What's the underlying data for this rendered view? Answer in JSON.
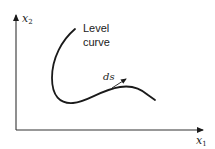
{
  "diagram": {
    "axes": {
      "y_label": "x",
      "y_sub": "2",
      "x_label": "x",
      "x_sub": "1"
    },
    "curve_label": {
      "line1": "Level",
      "line2": "curve"
    },
    "tangent_label": "ds",
    "colors": {
      "stroke": "#1a1a1a",
      "axis": "#333333",
      "background": "#ffffff"
    }
  }
}
